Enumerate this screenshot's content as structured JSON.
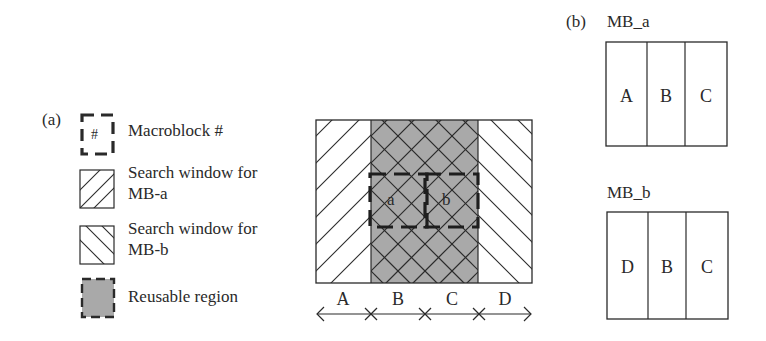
{
  "panel_a": {
    "label": "(a)",
    "legend": [
      {
        "icon": "macroblock-dashed-icon",
        "symbol": "#",
        "text": "Macroblock #"
      },
      {
        "icon": "forward-hatch-icon",
        "text_line1": "Search window for",
        "text_line2": "MB-a"
      },
      {
        "icon": "backward-hatch-icon",
        "text_line1": "Search window for",
        "text_line2": "MB-b"
      },
      {
        "icon": "gray-dashed-region-icon",
        "text": "Reusable region"
      }
    ],
    "diagram": {
      "macroblocks": [
        {
          "label": "a"
        },
        {
          "label": "b"
        }
      ],
      "columns": [
        "A",
        "B",
        "C",
        "D"
      ],
      "colors": {
        "reusable_fill": "#a9a9a9",
        "line": "#2a2a2a",
        "background": "#ffffff"
      }
    }
  },
  "panel_b": {
    "label": "(b)",
    "blocks": [
      {
        "title": "MB_a",
        "cells": [
          "A",
          "B",
          "C"
        ]
      },
      {
        "title": "MB_b",
        "cells": [
          "D",
          "B",
          "C"
        ]
      }
    ]
  }
}
